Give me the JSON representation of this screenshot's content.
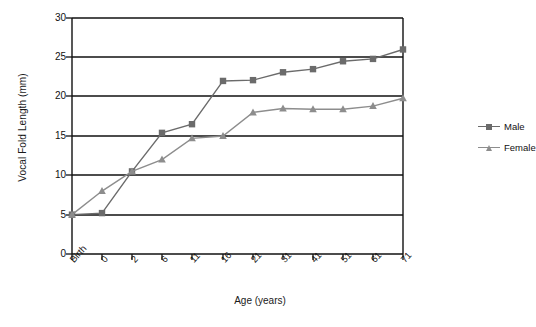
{
  "chart_data": {
    "type": "line",
    "title": "",
    "xlabel": "Age (years)",
    "ylabel": "Vocal Fold Length (mm)",
    "categories": [
      "Birth",
      "0",
      "2",
      "6",
      "11",
      "16",
      "21",
      "31",
      "41",
      "51",
      "61",
      "71"
    ],
    "ylim": [
      0,
      30
    ],
    "yticks": [
      0,
      5,
      10,
      15,
      20,
      25,
      30
    ],
    "grid": "horizontal",
    "legend_position": "right",
    "series": [
      {
        "name": "Male",
        "marker": "square",
        "color": "#6b6b6b",
        "values": [
          5.0,
          5.2,
          10.5,
          15.4,
          16.5,
          22.0,
          22.1,
          23.1,
          23.5,
          24.5,
          24.8,
          26.0
        ]
      },
      {
        "name": "Female",
        "marker": "triangle",
        "color": "#8d8d8d",
        "values": [
          5.0,
          8.0,
          10.5,
          12.0,
          14.7,
          15.0,
          18.0,
          18.5,
          18.4,
          18.4,
          18.8,
          19.8
        ]
      }
    ]
  },
  "axes": {
    "y_title": "Vocal Fold Length (mm)",
    "x_title": "Age (years)",
    "y_tick_labels": [
      "30",
      "25",
      "20",
      "15",
      "10",
      "5",
      "0"
    ],
    "x_tick_labels": [
      "Birth",
      "0",
      "2",
      "6",
      "11",
      "16",
      "21",
      "31",
      "41",
      "51",
      "61",
      "71"
    ]
  },
  "legend": {
    "items": [
      {
        "label": "Male"
      },
      {
        "label": "Female"
      }
    ]
  },
  "colors": {
    "male": "#6b6b6b",
    "female": "#8d8d8d",
    "axis": "#111111",
    "grid": "#111111",
    "background": "#ffffff"
  }
}
